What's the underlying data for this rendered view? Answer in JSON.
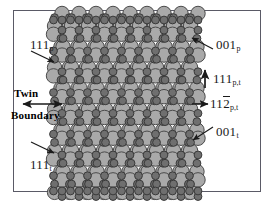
{
  "figure": {
    "kind": "crystal-lattice-twin-boundary-schematic",
    "background_color": "#ffffff",
    "frame_color": "#5a5a66"
  },
  "labels": {
    "twin_line1": "Twin",
    "twin_line2": "Boundary",
    "dir_111p": {
      "index": "111",
      "subscript": "p"
    },
    "dir_111t": {
      "index": "111",
      "subscript": "t"
    },
    "dir_001p": {
      "index": "001",
      "subscript": "p"
    },
    "dir_001t": {
      "index": "001",
      "subscript": "t"
    },
    "dir_111pt": {
      "index": "111",
      "subscript": "p,t"
    },
    "dir_112pt": {
      "prefix": "11",
      "barred": "2",
      "subscript": "p,t"
    }
  },
  "arrows": [
    {
      "name": "arrow-111p",
      "style": "single-head",
      "direction": "down-right"
    },
    {
      "name": "arrow-111t",
      "style": "single-head",
      "direction": "down-right"
    },
    {
      "name": "arrow-twin-boundary",
      "style": "double-head",
      "direction": "horizontal"
    },
    {
      "name": "arrow-001p",
      "style": "single-head",
      "direction": "down-left"
    },
    {
      "name": "arrow-001t",
      "style": "single-head",
      "direction": "down-left"
    },
    {
      "name": "arrow-111pt",
      "style": "single-head",
      "direction": "up"
    },
    {
      "name": "arrow-112pt",
      "style": "single-head",
      "direction": "right"
    }
  ],
  "lattice": {
    "atom_large": {
      "name": "large-atom",
      "fill": "#a9a9a9",
      "stroke": "#4a4a4a",
      "radius": 7.2
    },
    "atom_small": {
      "name": "small-atom",
      "fill": "#6f6f6f",
      "stroke": "#3a3a3a",
      "radius": 3.9
    },
    "void": {
      "name": "ring-void",
      "fill": "#ffffff"
    },
    "x_min": 58,
    "x_max": 194,
    "y_min": 22,
    "y_max": 190,
    "twin_boundary_y": 105,
    "column_spacing": 17,
    "row_spacing": 20.8
  }
}
